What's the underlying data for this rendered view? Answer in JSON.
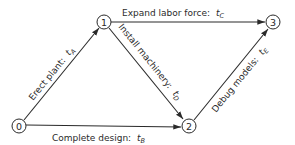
{
  "diagram": {
    "type": "activity-network",
    "nodes": [
      {
        "id": "0",
        "label": "0",
        "x": 19,
        "y": 126
      },
      {
        "id": "1",
        "label": "1",
        "x": 104,
        "y": 22
      },
      {
        "id": "2",
        "label": "2",
        "x": 189,
        "y": 126
      },
      {
        "id": "3",
        "label": "3",
        "x": 273,
        "y": 23
      }
    ],
    "edges": [
      {
        "from": "0",
        "to": "1",
        "activity": "Erect plant:",
        "time_var": "t",
        "time_sub": "A"
      },
      {
        "from": "1",
        "to": "3",
        "activity": "Expand labor force:",
        "time_var": "t",
        "time_sub": "C"
      },
      {
        "from": "1",
        "to": "2",
        "activity": "Install machinery:",
        "time_var": "t",
        "time_sub": "D"
      },
      {
        "from": "0",
        "to": "2",
        "activity": "Complete design:",
        "time_var": "t",
        "time_sub": "B"
      },
      {
        "from": "2",
        "to": "3",
        "activity": "Debug models:",
        "time_var": "t",
        "time_sub": "E"
      }
    ]
  }
}
